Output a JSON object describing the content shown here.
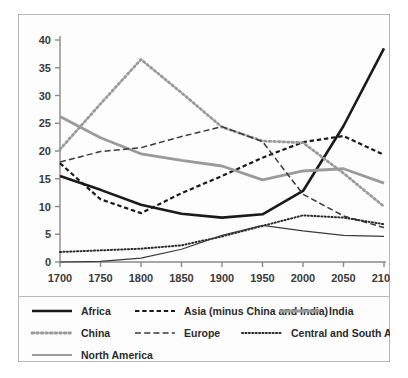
{
  "chart_data": {
    "type": "line",
    "title": "",
    "subtitle": "",
    "xlabel": "",
    "ylabel": "",
    "xlim": [
      1700,
      2100
    ],
    "ylim": [
      0,
      40
    ],
    "xticks": [
      1700,
      1750,
      1800,
      1850,
      1900,
      1950,
      2000,
      2050,
      2100
    ],
    "yticks": [
      0,
      5,
      10,
      15,
      20,
      25,
      30,
      35,
      40
    ],
    "grid": false,
    "legend_position": "bottom",
    "x": [
      1700,
      1750,
      1800,
      1850,
      1900,
      1950,
      2000,
      2050,
      2100
    ],
    "series": [
      {
        "name": "Africa",
        "style": "solid",
        "color": "#1a1a1a",
        "width": 2.6,
        "values": [
          15.5,
          13.0,
          10.3,
          8.7,
          8.0,
          8.6,
          12.8,
          24.5,
          38.5
        ]
      },
      {
        "name": "Asia (minus China and India)",
        "style": "dashed",
        "color": "#1a1a1a",
        "width": 2.2,
        "values": [
          17.8,
          11.3,
          8.8,
          12.4,
          15.5,
          18.8,
          21.6,
          22.7,
          19.3
        ]
      },
      {
        "name": "India",
        "style": "solid",
        "color": "#9a9a9a",
        "width": 2.8,
        "values": [
          26.2,
          22.4,
          19.5,
          18.3,
          17.3,
          14.8,
          16.4,
          16.8,
          14.2
        ]
      },
      {
        "name": "China",
        "style": "dotted",
        "color": "#9a9a9a",
        "width": 2.8,
        "values": [
          20.3,
          28.5,
          36.5,
          30.5,
          24.3,
          21.8,
          21.5,
          16.0,
          10.0
        ]
      },
      {
        "name": "Europe",
        "style": "longdash",
        "color": "#3a3a3a",
        "width": 1.5,
        "values": [
          18.0,
          19.9,
          20.6,
          22.6,
          24.4,
          21.7,
          12.2,
          8.3,
          6.2
        ]
      },
      {
        "name": "Central and South America",
        "style": "finedot",
        "color": "#2b2b2b",
        "width": 2.0,
        "values": [
          1.8,
          2.1,
          2.4,
          3.0,
          4.6,
          6.5,
          8.4,
          8.0,
          6.8
        ]
      },
      {
        "name": "North America",
        "style": "solid",
        "color": "#3a3a3a",
        "width": 1.2,
        "values": [
          0.0,
          0.1,
          0.7,
          2.3,
          4.8,
          6.6,
          5.6,
          4.8,
          4.6
        ]
      }
    ]
  },
  "legend": {
    "rows": [
      [
        {
          "label": "Africa",
          "style": "solid",
          "color": "#1a1a1a",
          "width": 2.6
        },
        {
          "label": "Asia (minus China and India)",
          "style": "dashed",
          "color": "#1a1a1a",
          "width": 2.2
        },
        {
          "label": "India",
          "style": "solid",
          "color": "#9a9a9a",
          "width": 2.8
        }
      ],
      [
        {
          "label": "China",
          "style": "dotted",
          "color": "#9a9a9a",
          "width": 2.8
        },
        {
          "label": "Europe",
          "style": "longdash",
          "color": "#3a3a3a",
          "width": 1.5
        },
        {
          "label": "Central and South America",
          "style": "finedot",
          "color": "#2b2b2b",
          "width": 2.0
        }
      ],
      [
        {
          "label": "North America",
          "style": "solid",
          "color": "#3a3a3a",
          "width": 1.2
        }
      ]
    ]
  },
  "colors": {
    "frame": "#b9b9b9",
    "axis": "#8a8a8a",
    "tick_label": "#3a3a3a",
    "background": "#ffffff"
  }
}
